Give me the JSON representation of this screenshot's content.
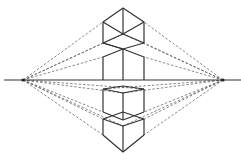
{
  "diagram": {
    "type": "two-point-perspective",
    "horizon_y": 80,
    "horizon_x_range": [
      4,
      241
    ],
    "vanishing_points": [
      {
        "name": "left-vp",
        "x": 23,
        "y": 80
      },
      {
        "name": "right-vp",
        "x": 223,
        "y": 80
      }
    ],
    "colors": {
      "line": "#333333",
      "guide": "#555555",
      "background": "#ffffff"
    },
    "boxes": [
      {
        "name": "top-cube",
        "front_x": 123,
        "left_x": 103,
        "right_x": 144
      },
      {
        "name": "upper-box-on-horizon",
        "front_x": 123,
        "left_x": 103,
        "right_x": 144
      },
      {
        "name": "lower-box-below-horizon",
        "front_x": 123,
        "left_x": 103,
        "right_x": 144
      },
      {
        "name": "bottom-cube",
        "front_x": 123,
        "left_x": 103,
        "right_x": 144
      }
    ]
  }
}
